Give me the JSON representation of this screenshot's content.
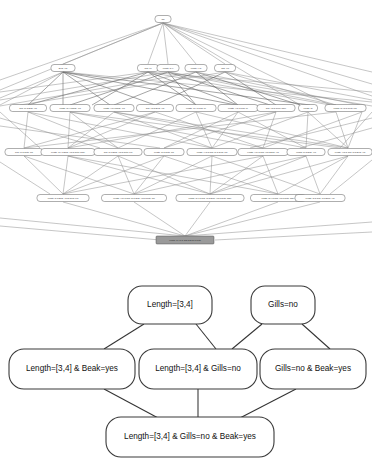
{
  "figure": {
    "background_color": "#ffffff",
    "panels": [
      {
        "id": "lattice",
        "name": "full-concept-lattice"
      },
      {
        "id": "concept",
        "name": "concept-sublattice-detail"
      }
    ]
  },
  "lattice_diagram": {
    "type": "hasse-diagram",
    "node_count": 31,
    "highlight_color": "#9a9a9a",
    "node_fill": "#ffffff",
    "edge_color": "#8d8d8d",
    "levels": [
      {
        "level": 0,
        "nodes": [
          {
            "id": "n0",
            "label": "Top",
            "x": 163,
            "y": 19,
            "w": 16,
            "h": 7
          }
        ]
      },
      {
        "level": 1,
        "nodes": [
          {
            "id": "n1",
            "label": "Beak=yes",
            "x": 63,
            "y": 68,
            "w": 24,
            "h": 7
          },
          {
            "id": "n2",
            "label": "Gills=no",
            "x": 148,
            "y": 68,
            "w": 21,
            "h": 7
          },
          {
            "id": "n3",
            "label": "Length=[3,4]",
            "x": 168,
            "y": 68,
            "w": 22,
            "h": 7
          },
          {
            "id": "n4",
            "label": "Length=[4,5]",
            "x": 196,
            "y": 68,
            "w": 22,
            "h": 7
          },
          {
            "id": "n5",
            "label": "Gills=yes",
            "x": 225,
            "y": 68,
            "w": 21,
            "h": 7
          }
        ]
      },
      {
        "level": 2,
        "nodes": [
          {
            "id": "n6",
            "label": "Gills=no & Beak=yes",
            "x": 28,
            "y": 108,
            "w": 37,
            "h": 7
          },
          {
            "id": "n7",
            "label": "Length=[3,4] & Beak=yes",
            "x": 70,
            "y": 108,
            "w": 40,
            "h": 7
          },
          {
            "id": "n8",
            "label": "Length=[4,5] & Beak=yes",
            "x": 114,
            "y": 108,
            "w": 40,
            "h": 7
          },
          {
            "id": "n9",
            "label": "Gills=yes & Beak=yes",
            "x": 155,
            "y": 108,
            "w": 37,
            "h": 7
          },
          {
            "id": "n10",
            "label": "Length=[3,4] & Gills=no",
            "x": 196,
            "y": 108,
            "w": 40,
            "h": 7
          },
          {
            "id": "n11",
            "label": "Length=[4,5] & Gills=no",
            "x": 238,
            "y": 108,
            "w": 40,
            "h": 7
          },
          {
            "id": "n12",
            "label": "Gills=yes & Teeth=many",
            "x": 276,
            "y": 108,
            "w": 38,
            "h": 7
          },
          {
            "id": "n13",
            "label": "Length=[5]",
            "x": 308,
            "y": 108,
            "w": 19,
            "h": 7
          },
          {
            "id": "n14",
            "label": "Length=[3,4,5] & Teeth=few",
            "x": 336,
            "y": 108,
            "w": 41,
            "h": 7
          },
          {
            "id": "n15",
            "label": "Length=[4,5] & Teeth=many",
            "x": 362,
            "y": 108,
            "w": 41,
            "h": 7
          }
        ]
      },
      {
        "level": 3,
        "nodes": [
          {
            "id": "n16",
            "label": "Gills=no & Teeth=few",
            "x": 24,
            "y": 152,
            "w": 38,
            "h": 7
          },
          {
            "id": "n17",
            "label": "Length=[3,4] & Beak=yes & Teeth=many",
            "x": 68,
            "y": 152,
            "w": 54,
            "h": 7
          },
          {
            "id": "n18",
            "label": "Gills=no & Beak=yes & Teeth=few",
            "x": 118,
            "y": 152,
            "w": 48,
            "h": 7
          },
          {
            "id": "n19",
            "label": "Length=[5] & Teeth=few",
            "x": 164,
            "y": 152,
            "w": 40,
            "h": 7
          },
          {
            "id": "n20",
            "label": "Length=[4,5] & Gills=no & Teeth=few",
            "x": 212,
            "y": 152,
            "w": 50,
            "h": 7
          },
          {
            "id": "n21",
            "label": "Length=[4,5] & Gills=yes & Beak=yes",
            "x": 263,
            "y": 152,
            "w": 50,
            "h": 7
          },
          {
            "id": "n22",
            "label": "Length=[5] & Beak=yes",
            "x": 306,
            "y": 152,
            "w": 38,
            "h": 7
          },
          {
            "id": "n23",
            "label": "Length=[4,5] & Gills=no & Beak=yes",
            "x": 348,
            "y": 152,
            "w": 50,
            "h": 7
          },
          {
            "id": "n24",
            "label": "Length=[3,4] & Gills=no & Beak=yes",
            "x": 393,
            "y": 152,
            "w": 50,
            "h": 7
          }
        ]
      },
      {
        "level": 4,
        "nodes": [
          {
            "id": "n25",
            "label": "Length=[5] & Beak=yes & Teeth=few",
            "x": 63,
            "y": 198,
            "w": 52,
            "h": 7
          },
          {
            "id": "n26",
            "label": "Length=[4,5] & Gills=no & Beak=yes & Teeth=few",
            "x": 134,
            "y": 198,
            "w": 65,
            "h": 7
          },
          {
            "id": "n27",
            "label": "Length=[3,4] & Gills=no & Beak=yes & Teeth=many",
            "x": 210,
            "y": 198,
            "w": 68,
            "h": 7
          },
          {
            "id": "n28",
            "label": "Length=[3,4] & Gills=yes & Teeth=many",
            "x": 278,
            "y": 198,
            "w": 55,
            "h": 7
          },
          {
            "id": "n29",
            "label": "Length=[5] & Gills=no & Beak=yes",
            "x": 380,
            "y": 198,
            "w": 50,
            "h": 7
          }
        ]
      },
      {
        "level": 5,
        "nodes": [
          {
            "id": "n30",
            "label": "Length=[3,4,5] & Gills & Beak & Teeth",
            "x": 185,
            "y": 240,
            "w": 58,
            "h": 8,
            "highlight": true
          }
        ]
      }
    ]
  },
  "concept_diagram": {
    "type": "hasse-diagram",
    "node_fill": "#ffffff",
    "node_stroke": "#3a3a3a",
    "edge_color": "#333333",
    "nodes": [
      {
        "id": "c1",
        "label": "Length=[3,4]",
        "x": 170,
        "y": 305,
        "w": 84,
        "h": 38
      },
      {
        "id": "c2",
        "label": "Gills=no",
        "x": 283,
        "y": 305,
        "w": 64,
        "h": 38
      },
      {
        "id": "c3",
        "label": "Length=[3,4] & Beak=yes",
        "x": 72,
        "y": 369,
        "w": 126,
        "h": 40
      },
      {
        "id": "c4",
        "label": "Length=[3,4] & Gills=no",
        "x": 198,
        "y": 369,
        "w": 118,
        "h": 40
      },
      {
        "id": "c5",
        "label": "Gills=no & Beak=yes",
        "x": 313,
        "y": 369,
        "w": 106,
        "h": 40
      },
      {
        "id": "c6",
        "label": "Length=[3,4] & Gills=no & Beak=yes",
        "x": 190,
        "y": 437,
        "w": 168,
        "h": 40
      }
    ],
    "edges": [
      {
        "from": "c1",
        "to": "c3"
      },
      {
        "from": "c1",
        "to": "c4"
      },
      {
        "from": "c2",
        "to": "c4"
      },
      {
        "from": "c2",
        "to": "c5"
      },
      {
        "from": "c3",
        "to": "c6"
      },
      {
        "from": "c4",
        "to": "c6"
      },
      {
        "from": "c5",
        "to": "c6"
      }
    ]
  }
}
